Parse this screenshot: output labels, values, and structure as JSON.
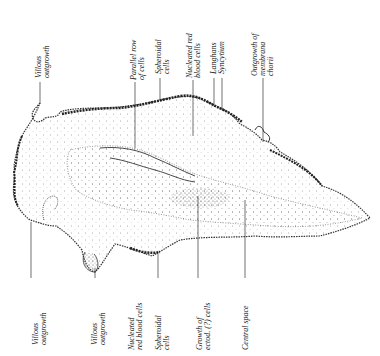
{
  "figure": {
    "type": "anatomical-illustration",
    "colors": {
      "ink": "#222222",
      "stipple": "#444444",
      "background": "#ffffff"
    }
  },
  "labels_top": [
    {
      "id": "villous-outgrowth-top",
      "lines": [
        "Villous",
        "outgrowth"
      ],
      "x": 36,
      "y_text_bottom": 78,
      "line_x": 40,
      "line_y1": 82,
      "line_y2": 102
    },
    {
      "id": "parallel-row-of-cells",
      "lines": [
        "Parallel row",
        "of cells"
      ],
      "x": 130,
      "y_text_bottom": 80,
      "line_x": 135,
      "line_y1": 82,
      "line_y2": 148
    },
    {
      "id": "spheroidal-cells-top",
      "lines": [
        "Spheroidal",
        "cells"
      ],
      "x": 155,
      "y_text_bottom": 74,
      "line_x": 160,
      "line_y1": 78,
      "line_y2": 100
    },
    {
      "id": "nucleated-red-blood-cells-top",
      "lines": [
        "Nucleated red",
        "blood cells"
      ],
      "x": 186,
      "y_text_bottom": 78,
      "line_x": 193,
      "line_y1": 80,
      "line_y2": 136
    },
    {
      "id": "langhans",
      "lines": [
        "Langhans"
      ],
      "x": 214,
      "y_text_bottom": 74,
      "line_x": 214,
      "line_y1": 78,
      "line_y2": 106
    },
    {
      "id": "syncytium",
      "lines": [
        "Syncytium"
      ],
      "x": 222,
      "y_text_bottom": 74,
      "line_x": 222,
      "line_y1": 78,
      "line_y2": 108
    },
    {
      "id": "outgrowth-of-membrana-chorii",
      "lines": [
        "Outgrowth of",
        "membrana",
        "chorii"
      ],
      "x": 251,
      "y_text_bottom": 76,
      "line_x": 263,
      "line_y1": 78,
      "line_y2": 142
    }
  ],
  "labels_bottom": [
    {
      "id": "villous-outgrowth-bottom-left",
      "lines": [
        "Villous",
        "outgrowth"
      ],
      "x": 32,
      "y_text_top": 345,
      "line_x": 31,
      "line_y1": 222,
      "line_y2": 278
    },
    {
      "id": "villous-outgrowth-bottom",
      "lines": [
        "Villous",
        "outgrowth"
      ],
      "x": 91,
      "y_text_top": 345,
      "line_x": 95,
      "line_y1": 268,
      "line_y2": 278
    },
    {
      "id": "nucleated-red-blood-cells-bottom",
      "lines": [
        "Nucleated",
        "red blood cells"
      ],
      "x": 128,
      "y_text_top": 350,
      "line_x": 158,
      "line_y1": 258,
      "line_y2": 278
    },
    {
      "id": "spheroidal-cells-bottom",
      "lines": [
        "Spheroidal",
        "cells"
      ],
      "x": 155,
      "y_text_top": 350,
      "line_x": 158,
      "line_y1": 258,
      "line_y2": 278
    },
    {
      "id": "growth-of-ectod-cells",
      "lines": [
        "Growth of",
        "ectod. (?) cells"
      ],
      "x": 196,
      "y_text_top": 350,
      "line_x": 198,
      "line_y1": 196,
      "line_y2": 278
    },
    {
      "id": "central-space",
      "lines": [
        "Central space"
      ],
      "x": 242,
      "y_text_top": 350,
      "line_x": 245,
      "line_y1": 200,
      "line_y2": 278
    }
  ]
}
